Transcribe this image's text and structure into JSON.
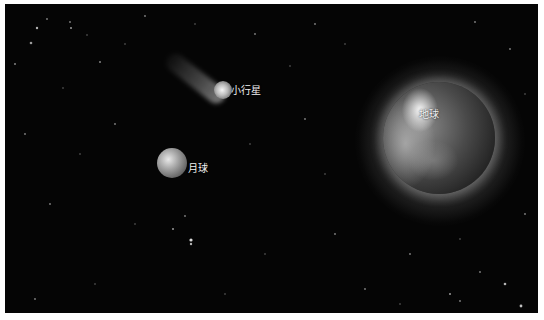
{
  "scene": {
    "background_color": "#050505",
    "border_color": "#ffffff"
  },
  "bodies": {
    "asteroid": {
      "label": "小行星"
    },
    "moon": {
      "label": "月球"
    },
    "earth": {
      "label": "地球"
    }
  }
}
